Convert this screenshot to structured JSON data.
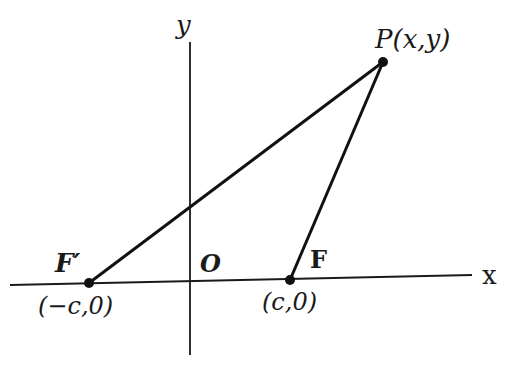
{
  "figure": {
    "axes": {
      "x_label": "x",
      "y_label": "y",
      "origin_label": "O"
    },
    "points": {
      "P": {
        "label": "P(x,y)"
      },
      "F": {
        "label": "F",
        "coords": "(c,0)"
      },
      "F_prime": {
        "label": "F′",
        "coords": "(−c,0)"
      }
    },
    "segments": [
      "F'P",
      "FP"
    ],
    "colors": {
      "ink": "#1a1a1a",
      "background": "#ffffff"
    }
  }
}
